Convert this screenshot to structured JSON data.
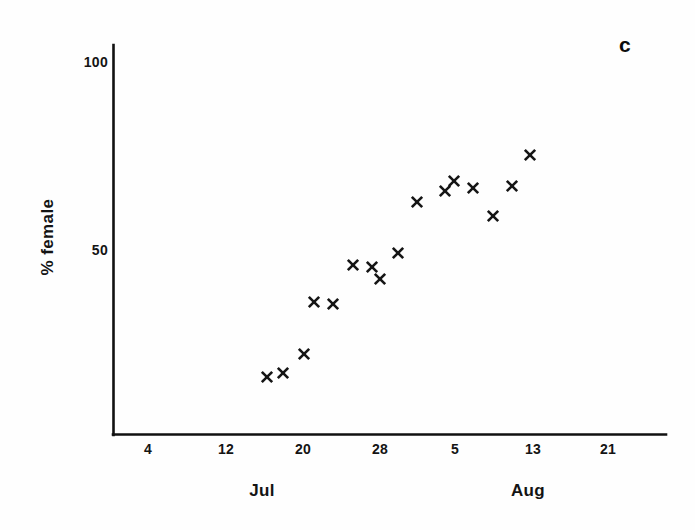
{
  "figure": {
    "panel_label": "c",
    "background_color": "#fefefe",
    "ink_color": "#141414"
  },
  "chart_data": {
    "type": "scatter",
    "title": "",
    "subtitle": "",
    "panel": "c",
    "xlabel": "",
    "ylabel": "% female",
    "marker": "x",
    "marker_color": "#151515",
    "grid": false,
    "legend": null,
    "x_axis": {
      "label": "",
      "tick_labels": [
        "4",
        "12",
        "20",
        "28",
        "5",
        "13",
        "21"
      ],
      "tick_values": [
        4,
        12,
        20,
        28,
        36,
        44,
        52
      ],
      "month_labels": [
        "Jul",
        "Aug"
      ],
      "month_positions": [
        18,
        42
      ],
      "range": [
        0,
        58
      ],
      "description": "Date: July 4 to August 21 (day-of-period axis)"
    },
    "y_axis": {
      "label": "% female",
      "tick_labels": [
        "50",
        "100"
      ],
      "tick_values": [
        50,
        100
      ],
      "range": [
        0,
        108
      ]
    },
    "points": [
      {
        "x_date": "Jul 16",
        "x": 16,
        "y": 16
      },
      {
        "x_date": "Jul 18",
        "x": 18,
        "y": 17
      },
      {
        "x_date": "Jul 20",
        "x": 20,
        "y": 22
      },
      {
        "x_date": "Jul 21",
        "x": 21,
        "y": 36
      },
      {
        "x_date": "Jul 23",
        "x": 23,
        "y": 36
      },
      {
        "x_date": "Jul 25",
        "x": 25,
        "y": 46
      },
      {
        "x_date": "Jul 27",
        "x": 27,
        "y": 45
      },
      {
        "x_date": "Jul 28",
        "x": 28,
        "y": 43
      },
      {
        "x_date": "Jul 30",
        "x": 30,
        "y": 49
      },
      {
        "x_date": "Aug 1",
        "x": 32,
        "y": 62
      },
      {
        "x_date": "Aug 4",
        "x": 35,
        "y": 65
      },
      {
        "x_date": "Aug 5",
        "x": 36,
        "y": 68
      },
      {
        "x_date": "Aug 7",
        "x": 38,
        "y": 66
      },
      {
        "x_date": "Aug 9",
        "x": 40,
        "y": 58
      },
      {
        "x_date": "Aug 11",
        "x": 42,
        "y": 66
      },
      {
        "x_date": "Aug 13",
        "x": 44,
        "y": 74
      }
    ],
    "pixel_points": [
      [
        267,
        377
      ],
      [
        283,
        373
      ],
      [
        304,
        354
      ],
      [
        314,
        302
      ],
      [
        333,
        304
      ],
      [
        353,
        265
      ],
      [
        372,
        267
      ],
      [
        380,
        279
      ],
      [
        398,
        253
      ],
      [
        417,
        202
      ],
      [
        445,
        191
      ],
      [
        454,
        181
      ],
      [
        473,
        188
      ],
      [
        493,
        216
      ],
      [
        512,
        186
      ],
      [
        530,
        155
      ]
    ],
    "axes_pixels": {
      "origin": [
        113,
        435
      ],
      "y_top": 45,
      "x_right": 666,
      "y_tick_pixels": {
        "100": 62,
        "50": 250
      },
      "x_tick_pixels": {
        "4": 148,
        "12": 226,
        "20": 303,
        "28": 380,
        "5": 455,
        "13": 533,
        "21": 608
      },
      "month_pixels": {
        "Jul": 262,
        "Aug": 528
      }
    }
  }
}
